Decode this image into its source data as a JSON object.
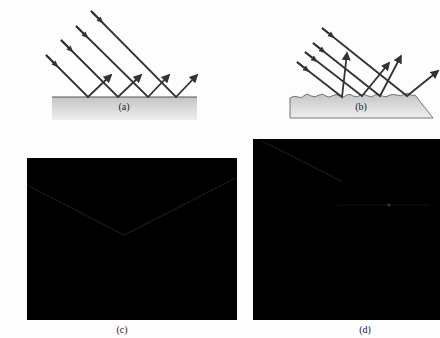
{
  "panels": {
    "a": {
      "label": "(a)",
      "type": "specular-reflection"
    },
    "b": {
      "label": "(b)",
      "type": "diffuse-reflection"
    },
    "c": {
      "label": "(c)",
      "type": "dark-photo"
    },
    "d": {
      "label": "(d)",
      "type": "dark-photo"
    }
  },
  "colors": {
    "ray": "#333333",
    "surface_top": "#c8c8c8",
    "surface_bottom": "#eeeeee",
    "panel_bg": "#000000",
    "background": "#fdfdfd"
  }
}
